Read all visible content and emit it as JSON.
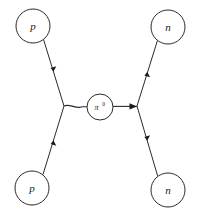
{
  "diagram": {
    "type": "feynman-diagram",
    "process": "p + p -> n + n",
    "background_color": "#ffffff",
    "line_color": "#2b2b2b",
    "label_color": "#1a1a1a",
    "nodes": [
      {
        "id": "top-left",
        "label": "p",
        "particle": "proton",
        "cx": 33,
        "cy": 26,
        "r": 17
      },
      {
        "id": "top-right",
        "label": "n",
        "particle": "neutron",
        "cx": 168,
        "cy": 27,
        "r": 17
      },
      {
        "id": "bottom-left",
        "label": "p",
        "particle": "proton",
        "cx": 32,
        "cy": 188,
        "r": 17
      },
      {
        "id": "bottom-right",
        "label": "n",
        "particle": "neutron",
        "cx": 168,
        "cy": 190,
        "r": 17
      }
    ],
    "exchange": {
      "id": "pion",
      "label": "π",
      "superscript": "0",
      "full_label": "π0",
      "particle": "neutral-pion",
      "cx": 100,
      "cy": 107,
      "r": 13
    },
    "vertices": [
      {
        "id": "left-vertex",
        "x": 64,
        "y": 106
      },
      {
        "id": "right-vertex",
        "x": 137,
        "y": 106
      }
    ],
    "legs": [
      {
        "id": "leg-incoming-top-left",
        "from": "top-left",
        "to": "left-vertex",
        "arrow_direction": "toward-vertex",
        "arrow_at": 0.52
      },
      {
        "id": "leg-incoming-bottom-left",
        "from": "bottom-left",
        "to": "left-vertex",
        "arrow_direction": "toward-vertex",
        "arrow_at": 0.52
      },
      {
        "id": "leg-outgoing-top-right",
        "from": "right-vertex",
        "to": "top-right",
        "arrow_direction": "toward-node",
        "arrow_at": 0.5
      },
      {
        "id": "leg-outgoing-bottom-right",
        "from": "right-vertex",
        "to": "bottom-right",
        "arrow_direction": "toward-node",
        "arrow_at": 0.5
      }
    ],
    "exchange_arrow": {
      "id": "exchange-arrow",
      "direction": "right",
      "x": 130,
      "y": 106
    }
  }
}
